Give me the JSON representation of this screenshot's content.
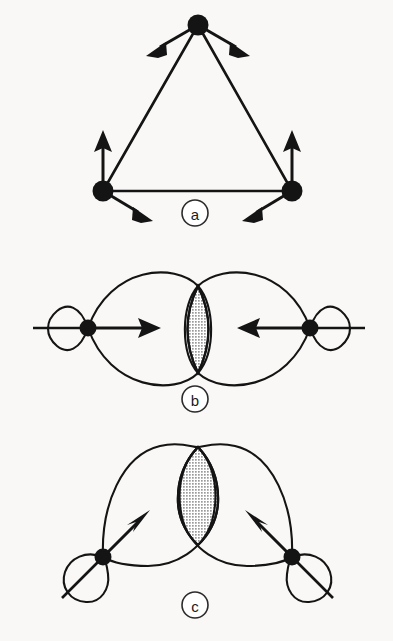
{
  "figure": {
    "background_color": "#f9f8f6",
    "ink_color": "#141414",
    "shading_color": "#bdbdbd",
    "width": 393,
    "height": 641
  },
  "panels": [
    {
      "id": "a",
      "label": "a",
      "caption_label": "a",
      "type": "triangular-cluster-with-vectors",
      "description": "Equilateral triangle of three filled atom nodes, each with two outward arrows",
      "atoms": [
        {
          "name": "apex-atom",
          "x": 198,
          "y": 25,
          "r": 10
        },
        {
          "name": "bottom-left-atom",
          "x": 103,
          "y": 191,
          "r": 10
        },
        {
          "name": "bottom-right-atom",
          "x": 292,
          "y": 191,
          "r": 10
        }
      ],
      "edges": [
        {
          "from": "apex-atom",
          "to": "bottom-left-atom"
        },
        {
          "from": "apex-atom",
          "to": "bottom-right-atom"
        },
        {
          "from": "bottom-left-atom",
          "to": "bottom-right-atom"
        }
      ],
      "arrows": [
        {
          "name": "apex-arrow-left",
          "x1": 198,
          "y1": 25,
          "x2": 152,
          "y2": 52
        },
        {
          "name": "apex-arrow-right",
          "x1": 198,
          "y1": 25,
          "x2": 244,
          "y2": 52
        },
        {
          "name": "bottom-left-arrow-up",
          "x1": 103,
          "y1": 191,
          "x2": 103,
          "y2": 132
        },
        {
          "name": "bottom-left-arrow-down",
          "x1": 103,
          "y1": 191,
          "x2": 149,
          "y2": 219
        },
        {
          "name": "bottom-right-arrow-up",
          "x1": 292,
          "y1": 191,
          "x2": 292,
          "y2": 132
        },
        {
          "name": "bottom-right-arrow-down",
          "x1": 292,
          "y1": 191,
          "x2": 246,
          "y2": 219
        }
      ],
      "badge": {
        "x": 195,
        "y": 213,
        "r": 13
      }
    },
    {
      "id": "b",
      "label": "b",
      "caption_label": "b",
      "type": "head-on-sigma-overlap",
      "description": "Two p orbitals pointing toward each other along a common axis, front lobes overlapping in a shaded lens",
      "atoms": [
        {
          "name": "left-atom",
          "x": 88,
          "y": 328,
          "r": 8
        },
        {
          "name": "right-atom",
          "x": 310,
          "y": 328,
          "r": 8
        }
      ],
      "arrows": [
        {
          "name": "left-arrow-right",
          "x1": 88,
          "y1": 328,
          "x2": 158,
          "y2": 328
        },
        {
          "name": "right-arrow-left",
          "x1": 310,
          "y1": 328,
          "x2": 240,
          "y2": 328
        }
      ],
      "overlap_region": {
        "name": "sigma-overlap-lens",
        "cx": 198,
        "cy": 329,
        "half_width": 20,
        "half_height": 43,
        "shaded": true
      },
      "badge": {
        "x": 195,
        "y": 399,
        "r": 13
      }
    },
    {
      "id": "c",
      "label": "c",
      "caption_label": "c",
      "type": "bent-banana-overlap",
      "description": "Two tilted p orbitals angled inward, curved front lobes meeting above the internuclear axis with a shaded lens",
      "atoms": [
        {
          "name": "left-atom",
          "x": 103,
          "y": 557,
          "r": 8
        },
        {
          "name": "right-atom",
          "x": 292,
          "y": 557,
          "r": 8
        }
      ],
      "arrows": [
        {
          "name": "left-arrow-up-right",
          "x1": 103,
          "y1": 557,
          "x2": 148,
          "y2": 512
        },
        {
          "name": "right-arrow-up-left",
          "x1": 292,
          "y1": 557,
          "x2": 247,
          "y2": 512
        }
      ],
      "overlap_region": {
        "name": "bent-overlap-lens",
        "cx": 198,
        "cy": 492,
        "half_width": 20,
        "half_height": 48,
        "shaded": true
      },
      "badge": {
        "x": 195,
        "y": 605,
        "r": 13
      }
    }
  ]
}
